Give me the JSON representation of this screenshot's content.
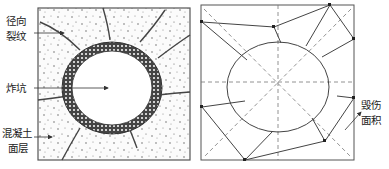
{
  "left_panel": {
    "title": "crater diagram",
    "labels": {
      "radial_crack_line1": "径向",
      "radial_crack_line2": "裂纹",
      "crater": "炸坑",
      "concrete_line1": "混凝土",
      "concrete_line2": "面层"
    }
  },
  "right_panel": {
    "title": "damage area diagram",
    "labels": {
      "damage_line1": "毁伤",
      "damage_line2": "面积"
    }
  },
  "colors": {
    "line": "#333333",
    "dashed": "#666666",
    "background": "#ffffff"
  }
}
